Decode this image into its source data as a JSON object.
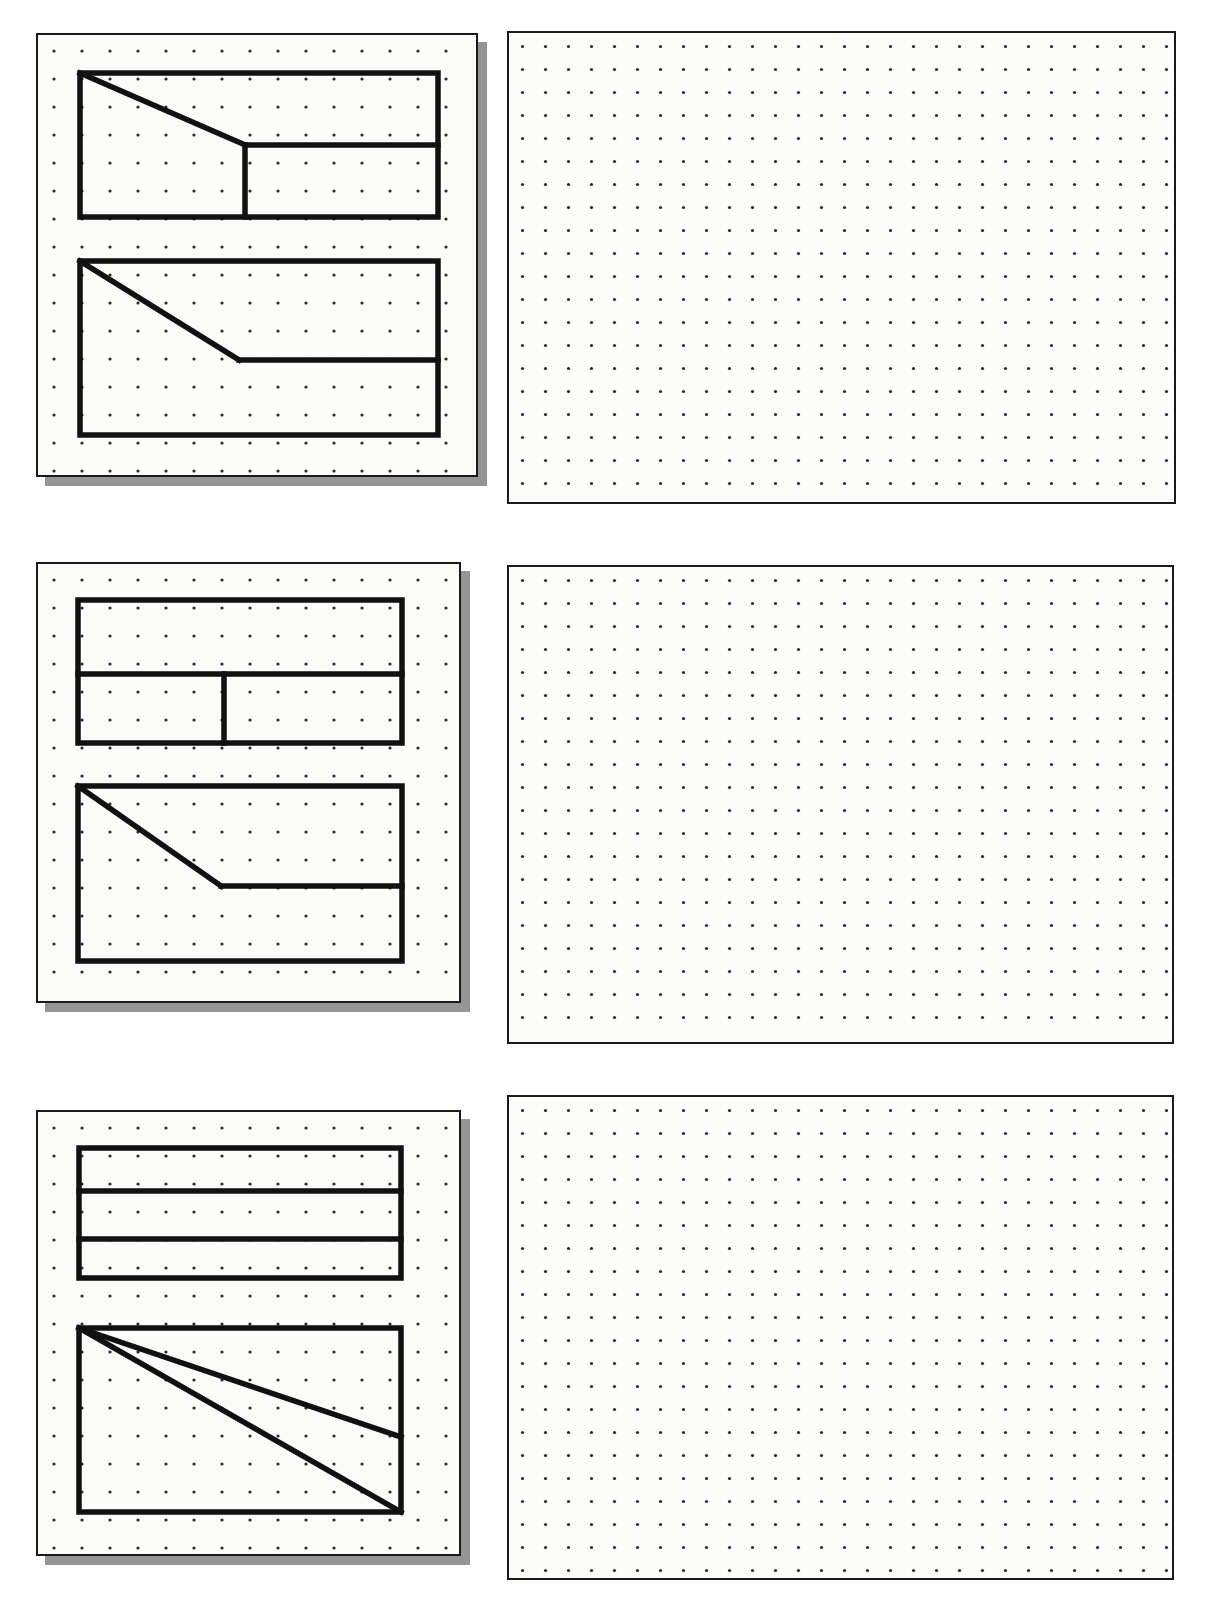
{
  "page": {
    "background_color": "#ffffff",
    "line_color": "#111111",
    "paper_color": "#fbfbfa",
    "shadow_color": "#828282",
    "width": 1230,
    "height": 1598
  },
  "grid": {
    "dot_color": "#2b2b2b",
    "dot_radius_px": 1.6,
    "left_panel_spacing_px": 28,
    "right_panel_spacing_px": 23,
    "description": "isometric-style square dot grid used as drawing aid"
  },
  "problems": [
    {
      "index": 1,
      "given_panel": {
        "name": "given-views-panel",
        "views": [
          {
            "view_name": "top-view",
            "shape": "rectangle-with-diagonal-and-vertical-divider",
            "outline": [
              [
                0,
                0
              ],
              [
                100,
                0
              ],
              [
                100,
                100
              ],
              [
                0,
                100
              ]
            ],
            "internal_edges": [
              {
                "name": "diagonal-cut",
                "points": [
                  [
                    0,
                    0
                  ],
                  [
                    46,
                    50
                  ]
                ]
              },
              {
                "name": "horizontal-step",
                "points": [
                  [
                    46,
                    50
                  ],
                  [
                    100,
                    50
                  ]
                ]
              },
              {
                "name": "vertical-divider",
                "points": [
                  [
                    46,
                    50
                  ],
                  [
                    46,
                    100
                  ]
                ]
              }
            ]
          },
          {
            "view_name": "front-view",
            "shape": "rectangle-with-diagonal-and-horizontal-step",
            "outline": [
              [
                0,
                0
              ],
              [
                100,
                0
              ],
              [
                100,
                100
              ],
              [
                0,
                100
              ]
            ],
            "internal_edges": [
              {
                "name": "diagonal-cut",
                "points": [
                  [
                    0,
                    0
                  ],
                  [
                    45,
                    57
                  ]
                ]
              },
              {
                "name": "horizontal-step",
                "points": [
                  [
                    45,
                    57
                  ],
                  [
                    100,
                    57
                  ]
                ]
              }
            ]
          }
        ]
      },
      "answer_panel": {
        "name": "answer-grid-panel",
        "state": "blank",
        "columns": 29,
        "rows": 20
      }
    },
    {
      "index": 2,
      "given_panel": {
        "name": "given-views-panel",
        "views": [
          {
            "view_name": "top-view",
            "shape": "rectangle-with-horizontal-divider-and-lower-vertical-divider",
            "outline": [
              [
                0,
                0
              ],
              [
                100,
                0
              ],
              [
                100,
                100
              ],
              [
                0,
                100
              ]
            ],
            "internal_edges": [
              {
                "name": "horizontal-divider",
                "points": [
                  [
                    0,
                    52
                  ],
                  [
                    100,
                    52
                  ]
                ]
              },
              {
                "name": "vertical-divider",
                "points": [
                  [
                    45,
                    52
                  ],
                  [
                    45,
                    100
                  ]
                ]
              }
            ]
          },
          {
            "view_name": "front-view",
            "shape": "rectangle-with-diagonal-and-horizontal-step",
            "outline": [
              [
                0,
                0
              ],
              [
                100,
                0
              ],
              [
                100,
                100
              ],
              [
                0,
                100
              ]
            ],
            "internal_edges": [
              {
                "name": "diagonal-cut",
                "points": [
                  [
                    0,
                    0
                  ],
                  [
                    44,
                    57
                  ]
                ]
              },
              {
                "name": "horizontal-step",
                "points": [
                  [
                    44,
                    57
                  ],
                  [
                    100,
                    57
                  ]
                ]
              }
            ]
          }
        ]
      },
      "answer_panel": {
        "name": "answer-grid-panel",
        "state": "blank",
        "columns": 29,
        "rows": 20
      }
    },
    {
      "index": 3,
      "given_panel": {
        "name": "given-views-panel",
        "views": [
          {
            "view_name": "top-view",
            "shape": "rectangle-with-two-horizontal-dividers",
            "outline": [
              [
                0,
                0
              ],
              [
                100,
                0
              ],
              [
                100,
                100
              ],
              [
                0,
                100
              ]
            ],
            "internal_edges": [
              {
                "name": "horizontal-divider-upper",
                "points": [
                  [
                    0,
                    33
                  ],
                  [
                    100,
                    33
                  ]
                ]
              },
              {
                "name": "horizontal-divider-lower",
                "points": [
                  [
                    0,
                    70
                  ],
                  [
                    100,
                    70
                  ]
                ]
              }
            ]
          },
          {
            "view_name": "front-view",
            "shape": "rectangle-with-two-diagonals-from-top-left",
            "outline": [
              [
                0,
                0
              ],
              [
                100,
                0
              ],
              [
                100,
                100
              ],
              [
                0,
                100
              ]
            ],
            "internal_edges": [
              {
                "name": "diagonal-upper",
                "points": [
                  [
                    0,
                    0
                  ],
                  [
                    100,
                    59
                  ]
                ]
              },
              {
                "name": "diagonal-lower",
                "points": [
                  [
                    0,
                    0
                  ],
                  [
                    100,
                    100
                  ]
                ]
              }
            ]
          }
        ]
      },
      "answer_panel": {
        "name": "answer-grid-panel",
        "state": "blank",
        "columns": 29,
        "rows": 21
      }
    }
  ]
}
